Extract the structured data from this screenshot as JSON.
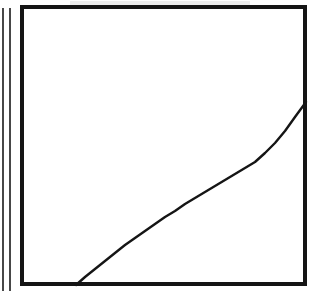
{
  "figure": {
    "kind": "scanned-line-figure",
    "background_color": "#ffffff",
    "ink_color": "#111111",
    "caption": "",
    "title": "",
    "width": 313,
    "height": 295
  },
  "plot_frame": {
    "name": "plot-frame",
    "x": 20,
    "y": 5,
    "width": 287,
    "height": 281,
    "border_width": 4,
    "border_color": "#151515",
    "fill": "#ffffff"
  },
  "margin_rules": [
    {
      "name": "margin-rule-outer",
      "x": 3,
      "y_top": 8,
      "y_bottom": 291,
      "stroke_width": 1.6,
      "color": "#1a1a1a"
    },
    {
      "name": "margin-rule-inner",
      "x": 10,
      "y_top": 8,
      "y_bottom": 291,
      "stroke_width": 1.6,
      "color": "#1a1a1a"
    }
  ],
  "chart_data": {
    "type": "line",
    "title": "",
    "subtitle": "",
    "xlabel": "",
    "ylabel": "",
    "grid": false,
    "legend_position": "none",
    "legend": [],
    "annotations": [],
    "xlim": [
      20,
      307
    ],
    "ylim": [
      286,
      5
    ],
    "axis_tick_labels": {
      "x": [],
      "y": []
    },
    "series": [
      {
        "name": "curve",
        "stroke_color": "#151515",
        "stroke_width": 2.4,
        "shape": "concave-down-rising",
        "start_point": [
          76,
          285
        ],
        "end_point": [
          306,
          102
        ],
        "x": [
          76,
          85,
          95,
          105,
          115,
          125,
          135,
          145,
          155,
          165,
          175,
          185,
          195,
          205,
          215,
          225,
          235,
          245,
          255,
          265,
          275,
          285,
          295,
          306
        ],
        "y": [
          285,
          277,
          269,
          261,
          253,
          245,
          238,
          231,
          224,
          217,
          211,
          204,
          198,
          192,
          186,
          180,
          174,
          168,
          162,
          153,
          143,
          131,
          117,
          102
        ]
      }
    ]
  },
  "scan_artifacts": {
    "name": "scan-speckle-band",
    "description": "faint horizontal speckle above the top border",
    "x": 70,
    "y": 1,
    "width": 180,
    "height": 4,
    "color": "#9a9a9a"
  }
}
